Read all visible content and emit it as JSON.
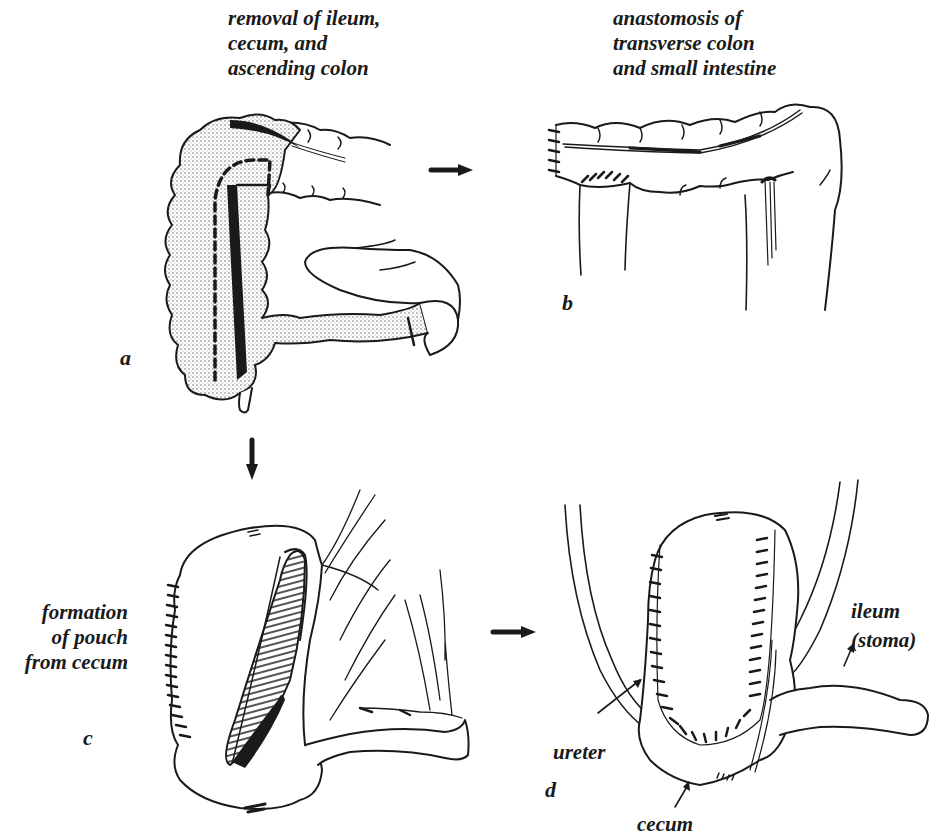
{
  "figure": {
    "panels": [
      {
        "id": "a",
        "letter": "a",
        "caption": [
          "removal of ileum,",
          "cecum, and",
          "ascending colon"
        ]
      },
      {
        "id": "b",
        "letter": "b",
        "caption": [
          "anastomosis of",
          "transverse colon",
          "and small intestine"
        ]
      },
      {
        "id": "c",
        "letter": "c",
        "caption": [
          "formation",
          "of pouch",
          "from cecum"
        ]
      },
      {
        "id": "d",
        "letter": "d",
        "caption": []
      }
    ],
    "annotations": {
      "ileum_stoma": [
        "ileum",
        "(stoma)"
      ],
      "ureter": "ureter",
      "cecum": "cecum"
    },
    "arrows": [
      {
        "from": "a",
        "to": "b",
        "direction": "right"
      },
      {
        "from": "a",
        "to": "c",
        "direction": "down"
      },
      {
        "from": "c",
        "to": "d",
        "direction": "right"
      }
    ],
    "colors": {
      "ink": "#1a1a1a",
      "stipple": "#d8d8d8",
      "background": "#ffffff"
    }
  }
}
